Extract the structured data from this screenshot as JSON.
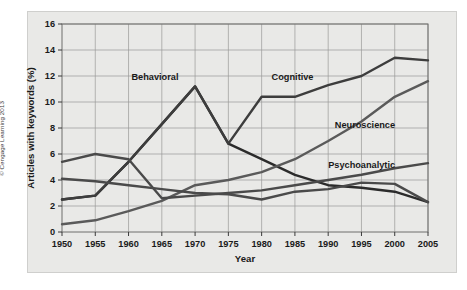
{
  "credit": "© Cengage Learning 2013",
  "chart_data": {
    "type": "line",
    "title": "",
    "xlabel": "Year",
    "ylabel": "Articles with keywords (%)",
    "xlim": [
      1950,
      2005
    ],
    "ylim": [
      0,
      16
    ],
    "xticks": [
      1950,
      1955,
      1960,
      1965,
      1970,
      1975,
      1980,
      1985,
      1990,
      1995,
      2000,
      2005
    ],
    "yticks": [
      0,
      2,
      4,
      6,
      8,
      10,
      12,
      14,
      16
    ],
    "xtick_labels": [
      "1950",
      "1955",
      "1960",
      "1965",
      "1970",
      "1975",
      "1980",
      "1985",
      "1990",
      "1995",
      "2000",
      "2005"
    ],
    "ytick_labels": [
      "0",
      "2",
      "4",
      "6",
      "8",
      "10",
      "12",
      "14",
      "16"
    ],
    "grid": true,
    "legend": "inline-annotations",
    "x": [
      1950,
      1955,
      1960,
      1965,
      1970,
      1975,
      1980,
      1985,
      1990,
      1995,
      2000,
      2005
    ],
    "series": [
      {
        "name": "Behavioral",
        "color": "#2b2b2b",
        "values": [
          2.5,
          2.8,
          5.4,
          8.3,
          11.2,
          6.8,
          5.6,
          4.4,
          3.6,
          3.4,
          3.1,
          2.3
        ],
        "label_x": 1967.5,
        "label_y": 11.7,
        "label_anchor": "end"
      },
      {
        "name": "Cognitive",
        "color": "#3d3d3d",
        "values": [
          2.5,
          2.8,
          5.4,
          8.3,
          11.2,
          6.8,
          10.4,
          10.4,
          11.3,
          12.0,
          13.4,
          13.2
        ],
        "label_x": 1981.5,
        "label_y": 11.7,
        "label_anchor": "start"
      },
      {
        "name": "Neuroscience",
        "color": "#5a5a5a",
        "values": [
          0.6,
          0.9,
          1.6,
          2.4,
          3.6,
          4.0,
          4.6,
          5.6,
          7.0,
          8.5,
          10.4,
          11.6
        ],
        "label_x": 1991.0,
        "label_y": 8.0,
        "label_anchor": "start"
      },
      {
        "name": "Psychoanalytic",
        "color": "#4a4a4a",
        "values": [
          4.1,
          3.9,
          3.6,
          3.3,
          3.0,
          2.9,
          2.5,
          3.1,
          3.3,
          3.8,
          3.7,
          2.3
        ],
        "label_x": 1990.0,
        "label_y": 4.9,
        "label_anchor": "start"
      },
      {
        "name": "Behavioral-early",
        "color": "#4a4a4a",
        "values": [
          5.4,
          6.0,
          5.6,
          2.6,
          2.8,
          3.0,
          3.2,
          3.6,
          4.0,
          4.4,
          4.9,
          5.3
        ],
        "label_x": null,
        "label_y": null,
        "label_anchor": "start"
      }
    ]
  }
}
